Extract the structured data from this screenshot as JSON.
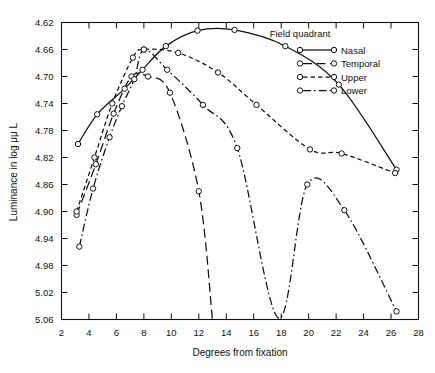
{
  "chart_data": {
    "type": "line",
    "title": "",
    "xlabel": "Degrees from fixation",
    "ylabel": "Luminance in log μμ L",
    "legend_title": "Field quadrant",
    "legend_position": "top-right-inside",
    "grid": false,
    "y_inverted": true,
    "xlim": [
      2,
      28
    ],
    "ylim": [
      5.06,
      4.62
    ],
    "xticks": [
      2,
      4,
      6,
      8,
      10,
      12,
      14,
      16,
      18,
      20,
      22,
      24,
      26,
      28
    ],
    "xtick_labels": [
      "2",
      "4",
      "6",
      "8",
      "10",
      "12",
      "14",
      "16",
      "18",
      "20",
      "22",
      "24",
      "26",
      "28"
    ],
    "yticks": [
      4.62,
      4.66,
      4.7,
      4.74,
      4.78,
      4.82,
      4.86,
      4.9,
      4.94,
      4.98,
      5.02,
      5.06
    ],
    "ytick_labels": [
      "4.62",
      "4.66",
      "4.70",
      "4.74",
      "4.78",
      "4.82",
      "4.86",
      "4.90",
      "4.94",
      "4.98",
      "5.02",
      "5.06"
    ],
    "series": [
      {
        "name": "Nasal",
        "dash": "solid",
        "marker": "circle",
        "x": [
          3.2,
          4.6,
          6.6,
          7.9,
          9.6,
          11.9,
          14.6,
          18.3,
          22.2,
          26.4
        ],
        "y": [
          4.8,
          4.756,
          4.718,
          4.69,
          4.655,
          4.632,
          4.631,
          4.655,
          4.712,
          4.838
        ]
      },
      {
        "name": "Temporal",
        "dash": "long-dash",
        "marker": "circle",
        "x": [
          3.1,
          4.5,
          5.8,
          7.1,
          8.3,
          9.9,
          12.0,
          13.0
        ],
        "y": [
          4.905,
          4.83,
          4.755,
          4.7,
          4.7,
          4.724,
          4.87,
          5.062
        ]
      },
      {
        "name": "Upper",
        "dash": "short-dash",
        "marker": "circle",
        "x": [
          3.1,
          4.4,
          5.7,
          7.2,
          8.0,
          10.5,
          13.4,
          16.2,
          20.1,
          22.4,
          26.3
        ],
        "y": [
          4.9,
          4.82,
          4.74,
          4.672,
          4.66,
          4.665,
          4.694,
          4.742,
          4.808,
          4.814,
          4.843
        ]
      },
      {
        "name": "Lower",
        "dash": "dash-dot",
        "marker": "circle",
        "x": [
          3.3,
          4.3,
          5.5,
          6.4,
          7.3,
          8.0,
          9.7,
          12.3,
          14.8,
          17.8,
          19.9,
          22.6,
          26.4
        ],
        "y": [
          4.952,
          4.866,
          4.79,
          4.744,
          4.704,
          4.66,
          4.69,
          4.742,
          4.806,
          5.058,
          4.86,
          4.898,
          5.048
        ]
      }
    ]
  },
  "legend": {
    "title": "Field quadrant",
    "entries": [
      {
        "label": "Nasal",
        "dash": "solid"
      },
      {
        "label": "Temporal",
        "dash": "long-dash"
      },
      {
        "label": "Upper",
        "dash": "short-dash"
      },
      {
        "label": "Lower",
        "dash": "dash-dot"
      }
    ]
  }
}
